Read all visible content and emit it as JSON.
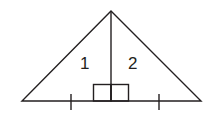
{
  "diagram": {
    "type": "isosceles triangle split by altitude",
    "labels": {
      "left_region": "1",
      "right_region": "2"
    },
    "colors": {
      "stroke": "#231f20",
      "background": "#ffffff"
    },
    "features": [
      "altitude from apex to base",
      "right-angle marks at foot of altitude",
      "tick marks indicating equal base segments"
    ]
  }
}
